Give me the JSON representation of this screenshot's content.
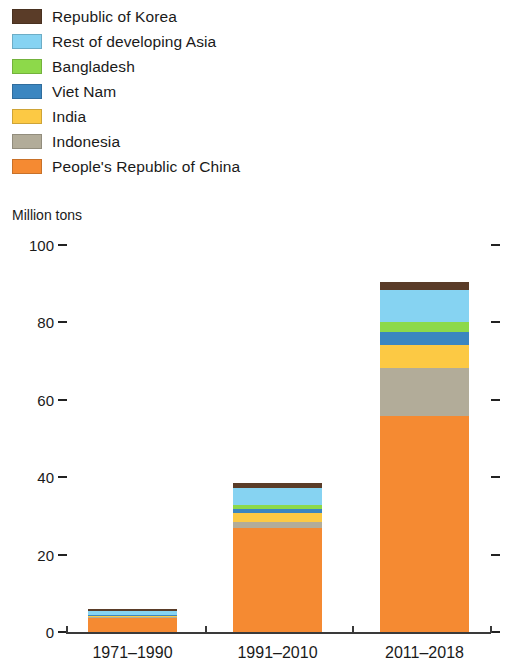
{
  "unit_caption": "Million tons",
  "legend": {
    "items": [
      {
        "label": "Republic of Korea",
        "color": "#5a3c28"
      },
      {
        "label": "Rest of developing Asia",
        "color": "#86d3f2"
      },
      {
        "label": "Bangladesh",
        "color": "#8dd94a"
      },
      {
        "label": "Viet Nam",
        "color": "#3b86c0"
      },
      {
        "label": "India",
        "color": "#fcc944"
      },
      {
        "label": "Indonesia",
        "color": "#b2ac99"
      },
      {
        "label": "People's Republic of China",
        "color": "#f58a32"
      }
    ]
  },
  "chart_data": {
    "type": "bar",
    "stacked": true,
    "title": "",
    "subtitle": "",
    "xlabel": "",
    "ylabel": "Million tons",
    "ylim": [
      0,
      100
    ],
    "yticks": [
      "0",
      "20",
      "40",
      "60",
      "80",
      "100"
    ],
    "ytick_values": [
      0,
      20,
      40,
      60,
      80,
      100
    ],
    "grid": false,
    "legend_position": "top-left",
    "categories": [
      "1971–1990",
      "1991–2010",
      "2011–2018"
    ],
    "series": [
      {
        "name": "People's Republic of China",
        "color": "#f58a32",
        "values": [
          3.5,
          27.0,
          55.8
        ]
      },
      {
        "name": "Indonesia",
        "color": "#b2ac99",
        "values": [
          0.3,
          1.5,
          12.4
        ]
      },
      {
        "name": "India",
        "color": "#fcc944",
        "values": [
          0.3,
          2.3,
          5.9
        ]
      },
      {
        "name": "Viet Nam",
        "color": "#3b86c0",
        "values": [
          0.2,
          1.0,
          3.4
        ]
      },
      {
        "name": "Bangladesh",
        "color": "#8dd94a",
        "values": [
          0.2,
          1.0,
          2.6
        ]
      },
      {
        "name": "Rest of developing Asia",
        "color": "#86d3f2",
        "values": [
          1.0,
          4.4,
          8.3
        ]
      },
      {
        "name": "Republic of Korea",
        "color": "#5a3c28",
        "values": [
          0.5,
          1.3,
          2.1
        ]
      }
    ],
    "totals": [
      6.0,
      38.5,
      90.5
    ]
  }
}
